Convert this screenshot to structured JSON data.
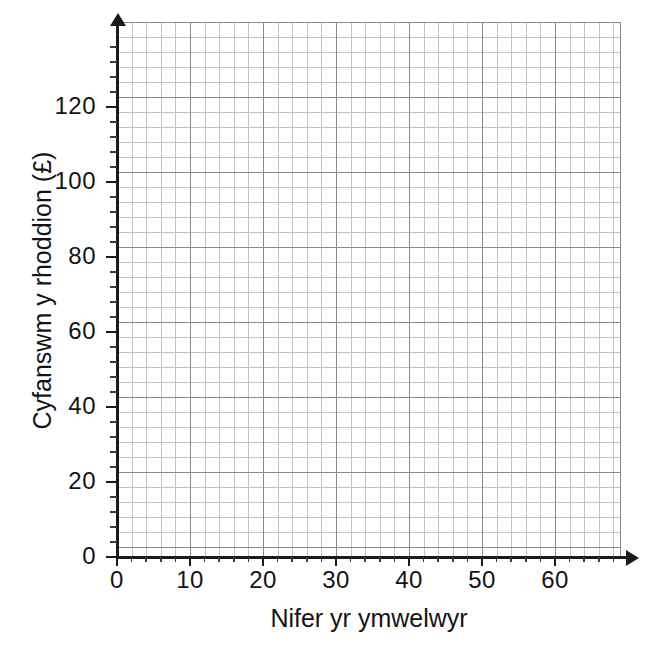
{
  "chart_data": {
    "type": "scatter",
    "title": "",
    "subtitle": "",
    "xlabel": "Nifer yr ymwelwyr",
    "ylabel": "Cyfanswm y rhoddion (£)",
    "xlim": [
      0,
      69
    ],
    "ylim": [
      0,
      143
    ],
    "x_ticks": [
      0,
      10,
      20,
      30,
      40,
      50,
      60
    ],
    "x_tick_labels": [
      "0",
      "10",
      "20",
      "30",
      "40",
      "50",
      "60"
    ],
    "y_ticks": [
      0,
      20,
      40,
      60,
      80,
      100,
      120
    ],
    "y_tick_labels": [
      "0",
      "20",
      "40",
      "60",
      "80",
      "100",
      "120"
    ],
    "x_minor_step": 2,
    "y_minor_step": 4,
    "grid": true,
    "grid_major_color": "#8a8a8a",
    "grid_minor_color": "#c2c2c2",
    "axis_color": "#1a1a1a",
    "background_color": "#ffffff",
    "legend": null,
    "legend_position": "none",
    "series": [],
    "annotations": [],
    "note": "Blank graph paper axes with no plotted data"
  },
  "axes": {
    "x": {
      "label": "Nifer yr ymwelwyr",
      "ticks": [
        {
          "value": 0,
          "label": "0"
        },
        {
          "value": 10,
          "label": "10"
        },
        {
          "value": 20,
          "label": "20"
        },
        {
          "value": 30,
          "label": "30"
        },
        {
          "value": 40,
          "label": "40"
        },
        {
          "value": 50,
          "label": "50"
        },
        {
          "value": 60,
          "label": "60"
        }
      ]
    },
    "y": {
      "label": "Cyfanswm y rhoddion (£)",
      "ticks": [
        {
          "value": 0,
          "label": "0"
        },
        {
          "value": 20,
          "label": "20"
        },
        {
          "value": 40,
          "label": "40"
        },
        {
          "value": 60,
          "label": "60"
        },
        {
          "value": 80,
          "label": "80"
        },
        {
          "value": 100,
          "label": "100"
        },
        {
          "value": 120,
          "label": "120"
        }
      ]
    }
  }
}
